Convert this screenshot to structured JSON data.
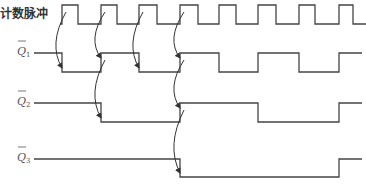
{
  "diagram": {
    "type": "timing-diagram",
    "signals": [
      {
        "id": "clk",
        "label": "计数脉冲",
        "label_type": "text",
        "y_high": 5,
        "y_low": 24,
        "start_x": 30,
        "end_x": 366,
        "initial": "low",
        "transitions": [
          62,
          78,
          101,
          117,
          139,
          157,
          180,
          198,
          219,
          236,
          258,
          276,
          299,
          315,
          339,
          353
        ]
      },
      {
        "id": "q1bar",
        "label": "Q",
        "subscript": "1",
        "overbar": true,
        "label_type": "q",
        "y_high": 53,
        "y_low": 72,
        "start_x": 30,
        "end_x": 362,
        "initial": "high",
        "transitions": [
          62,
          101,
          139,
          180,
          219,
          258,
          299,
          339
        ]
      },
      {
        "id": "q2bar",
        "label": "Q",
        "subscript": "2",
        "overbar": true,
        "label_type": "q",
        "y_high": 103,
        "y_low": 122,
        "start_x": 30,
        "end_x": 362,
        "initial": "high",
        "transitions": [
          101,
          180,
          258,
          339
        ]
      },
      {
        "id": "q3bar",
        "label": "Q",
        "subscript": "3",
        "overbar": true,
        "label_type": "q",
        "y_high": 159,
        "y_low": 177,
        "start_x": 30,
        "end_x": 362,
        "initial": "high",
        "transitions": [
          180,
          339
        ]
      }
    ],
    "arrows": [
      {
        "from_x": 62,
        "from_y": 20,
        "to_x": 62,
        "to_y": 68,
        "bulge": -7
      },
      {
        "from_x": 101,
        "from_y": 20,
        "to_x": 101,
        "to_y": 58,
        "bulge": -7
      },
      {
        "from_x": 139,
        "from_y": 20,
        "to_x": 139,
        "to_y": 68,
        "bulge": -7
      },
      {
        "from_x": 180,
        "from_y": 20,
        "to_x": 180,
        "to_y": 58,
        "bulge": -7
      },
      {
        "from_x": 101,
        "from_y": 68,
        "to_x": 101,
        "to_y": 118,
        "bulge": -7
      },
      {
        "from_x": 180,
        "from_y": 68,
        "to_x": 180,
        "to_y": 108,
        "bulge": -7
      },
      {
        "from_x": 180,
        "from_y": 118,
        "to_x": 180,
        "to_y": 173,
        "bulge": -7
      }
    ],
    "colors": {
      "line": "#444444",
      "text": "#333333",
      "background": "#ffffff"
    }
  }
}
